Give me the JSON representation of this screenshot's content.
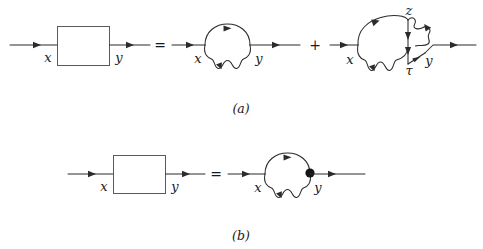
{
  "figure": {
    "caption_a": "(a)",
    "caption_b": "(b)",
    "rows": [
      {
        "id": "row-a",
        "caption": "(a)",
        "equation_ops": [
          "=",
          "+"
        ],
        "terms": [
          {
            "id": "a-lhs",
            "kind": "box-propagator",
            "labels": {
              "left": "x",
              "right": "y"
            },
            "box": true
          },
          {
            "id": "a-term1",
            "kind": "self-energy-loop",
            "labels": {
              "left": "x",
              "right": "y"
            },
            "box": false
          },
          {
            "id": "a-term2",
            "kind": "vertex-correction-loop",
            "labels": {
              "left": "x",
              "right": "y",
              "top": "z",
              "bottom": "τ"
            },
            "box": false
          }
        ]
      },
      {
        "id": "row-b",
        "caption": "(b)",
        "equation_ops": [
          "="
        ],
        "terms": [
          {
            "id": "b-lhs",
            "kind": "box-propagator",
            "labels": {
              "left": "x",
              "right": "y"
            },
            "box": true
          },
          {
            "id": "b-rhs",
            "kind": "self-energy-loop-blob",
            "labels": {
              "left": "x",
              "right": "y"
            },
            "box": false
          }
        ]
      }
    ],
    "labels": {
      "x": "x",
      "y": "y",
      "z": "z",
      "tau": "τ",
      "equals": "=",
      "plus": "+"
    },
    "colors": {
      "line": "#2b2b2b",
      "box_border": "#5a5a5a",
      "text": "#1a1a1a",
      "background": "#ffffff",
      "blob": "#151515"
    }
  }
}
